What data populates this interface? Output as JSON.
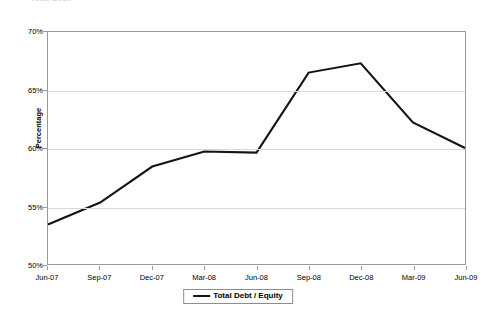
{
  "clipped_title": "Total Debt",
  "legend": {
    "label": "Total Debt / Equity",
    "position": "bottom-center",
    "series_color": "#141414"
  },
  "axes": {
    "y_title": "Percentage",
    "y_ticks": [
      "50%",
      "55%",
      "60%",
      "65%",
      "70%"
    ],
    "x_ticks": [
      "Jun-07",
      "Sep-07",
      "Dec-07",
      "Mar-08",
      "Jun-08",
      "Sep-08",
      "Dec-08",
      "Mar-09",
      "Jun-09"
    ]
  },
  "chart_data": {
    "type": "line",
    "title": "",
    "xlabel": "",
    "ylabel": "Percentage",
    "categories": [
      "Jun-07",
      "Sep-07",
      "Dec-07",
      "Mar-08",
      "Jun-08",
      "Sep-08",
      "Dec-08",
      "Mar-09",
      "Jun-09"
    ],
    "series": [
      {
        "name": "Total Debt / Equity",
        "color": "#141414",
        "values": [
          53.4,
          55.3,
          58.4,
          59.7,
          59.6,
          66.5,
          67.3,
          62.2,
          60.0
        ]
      }
    ],
    "ylim": [
      50,
      70
    ],
    "y_tick_step": 5,
    "y_tick_format": "percent",
    "grid": "horizontal",
    "legend_position": "bottom"
  }
}
